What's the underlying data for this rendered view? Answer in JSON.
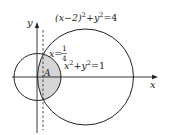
{
  "diagram": {
    "axes": {
      "x_label": "x",
      "y_label": "y"
    },
    "curves": [
      {
        "id": "small-circle",
        "equation": "x^2+y^2=1",
        "label_base": "x",
        "label_mid": "+y",
        "label_end": "=1",
        "sup1": "2",
        "sup2": "2"
      },
      {
        "id": "large-circle",
        "equation": "(x-2)^2+y^2=4",
        "label_base": "(x−2)",
        "label_mid": "+y",
        "label_end": "=4",
        "sup1": "2",
        "sup2": "2"
      }
    ],
    "line": {
      "equation": "x=1/4",
      "label_lhs": "x=",
      "numerator": "1",
      "denominator": "4"
    },
    "region_label": "A",
    "colors": {
      "stroke": "#222222",
      "shade": "#d6d6d6",
      "background": "#ffffff"
    }
  }
}
